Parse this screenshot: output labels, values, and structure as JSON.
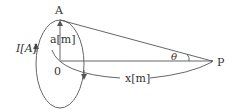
{
  "diagram": {
    "labels": {
      "point_a": "A",
      "radius": "a[m]",
      "current": "I[A]",
      "center": "0",
      "distance": "x[m]",
      "angle": "θ",
      "point_p": "P"
    },
    "colors": {
      "stroke": "#555555",
      "text": "#333333",
      "background": "#ffffff"
    }
  }
}
